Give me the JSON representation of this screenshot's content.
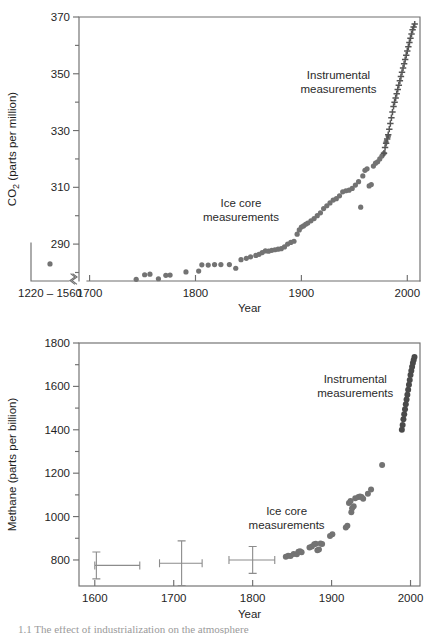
{
  "figure": {
    "background": "#ffffff",
    "marker_color_icecore": "#737373",
    "marker_color_instrumental": "#555555",
    "axis_color": "#6f6f6f",
    "errorbar_color": "#8c8c8c",
    "caption_partial": "1.1  The effect of industrialization on the atmosphere"
  },
  "chart_data": [
    {
      "type": "scatter",
      "id": "co2-panel",
      "title": "",
      "xlabel": "Year",
      "ylabel": "CO2 (parts per million)",
      "ylabel_parts": {
        "pre": "CO",
        "sub": "2",
        "post": " (parts per million)"
      },
      "xlim": [
        1690,
        2012
      ],
      "ylim": [
        277,
        370
      ],
      "grid": false,
      "legend": "none",
      "yticks": [
        290,
        310,
        330,
        350,
        370
      ],
      "yticklabels": [
        "290",
        "310",
        "330",
        "350",
        "370"
      ],
      "yminorticks": [
        280,
        300,
        320,
        340,
        360
      ],
      "xticks": [
        1700,
        1800,
        1900,
        2000
      ],
      "xticklabels": [
        "1700",
        "1800",
        "1900",
        "2000"
      ],
      "broken_axis": {
        "present": true,
        "inset_label": "1220 – 1560",
        "inset_points": [
          {
            "x_label": "1220-1560",
            "y": 283
          }
        ]
      },
      "annotations": [
        {
          "text_line1": "Instrumental",
          "text_line2": "measurements",
          "x": 1935,
          "y": 348
        },
        {
          "text_line1": "Ice core",
          "text_line2": "measurements",
          "x": 1843,
          "y": 303
        }
      ],
      "series": [
        {
          "name": "Ice core measurements",
          "marker": "circle",
          "color": "#737373",
          "points": [
            [
              1744,
              277.6
            ],
            [
              1752,
              279.2
            ],
            [
              1757,
              279.4
            ],
            [
              1765,
              277.8
            ],
            [
              1772,
              279.0
            ],
            [
              1776,
              279.1
            ],
            [
              1791,
              280.2
            ],
            [
              1803,
              280.5
            ],
            [
              1806,
              282.7
            ],
            [
              1812,
              282.6
            ],
            [
              1818,
              282.8
            ],
            [
              1824,
              282.8
            ],
            [
              1832,
              282.8
            ],
            [
              1838,
              281.5
            ],
            [
              1843,
              284.5
            ],
            [
              1848,
              285.0
            ],
            [
              1852,
              285.5
            ],
            [
              1857,
              286.0
            ],
            [
              1860,
              286.4
            ],
            [
              1863,
              287.0
            ],
            [
              1866,
              287.6
            ],
            [
              1869,
              287.5
            ],
            [
              1872,
              287.8
            ],
            [
              1875,
              288.0
            ],
            [
              1878,
              288.2
            ],
            [
              1881,
              288.4
            ],
            [
              1884,
              289.0
            ],
            [
              1887,
              290.0
            ],
            [
              1890,
              290.6
            ],
            [
              1893,
              291.0
            ],
            [
              1896,
              293.5
            ],
            [
              1898,
              295.0
            ],
            [
              1900,
              296.0
            ],
            [
              1902,
              296.4
            ],
            [
              1904,
              297.0
            ],
            [
              1906,
              297.4
            ],
            [
              1909,
              298.2
            ],
            [
              1912,
              299.0
            ],
            [
              1915,
              300.0
            ],
            [
              1918,
              301.0
            ],
            [
              1921,
              302.5
            ],
            [
              1924,
              303.5
            ],
            [
              1927,
              304.5
            ],
            [
              1930,
              305.5
            ],
            [
              1933,
              306.0
            ],
            [
              1936,
              307.0
            ],
            [
              1939,
              308.4
            ],
            [
              1942,
              308.8
            ],
            [
              1945,
              309.0
            ],
            [
              1948,
              309.6
            ],
            [
              1951,
              310.8
            ],
            [
              1954,
              312.0
            ],
            [
              1956,
              303.0
            ],
            [
              1958,
              314.0
            ],
            [
              1960,
              316.0
            ],
            [
              1962,
              316.5
            ],
            [
              1964,
              310.5
            ],
            [
              1966,
              311.0
            ],
            [
              1968,
              317.5
            ],
            [
              1970,
              318.5
            ],
            [
              1972,
              319.0
            ],
            [
              1974,
              320.0
            ],
            [
              1976,
              321.0
            ],
            [
              1978,
              322.0
            ],
            [
              1980,
              326.0
            ],
            [
              1982,
              328.0
            ]
          ]
        },
        {
          "name": "Instrumental measurements",
          "marker": "plus",
          "color": "#555555",
          "points": [
            [
              1978,
              322.0
            ],
            [
              1979,
              324.0
            ],
            [
              1980,
              325.5
            ],
            [
              1981,
              327.0
            ],
            [
              1982,
              328.5
            ],
            [
              1983,
              330.5
            ],
            [
              1984,
              332.5
            ],
            [
              1985,
              334.5
            ],
            [
              1986,
              336.5
            ],
            [
              1987,
              338.5
            ],
            [
              1988,
              340.0
            ],
            [
              1989,
              341.5
            ],
            [
              1990,
              343.0
            ],
            [
              1991,
              344.5
            ],
            [
              1992,
              346.0
            ],
            [
              1993,
              347.5
            ],
            [
              1994,
              349.0
            ],
            [
              1995,
              350.5
            ],
            [
              1996,
              352.0
            ],
            [
              1997,
              353.5
            ],
            [
              1998,
              355.0
            ],
            [
              1999,
              356.5
            ],
            [
              2000,
              358.0
            ],
            [
              2001,
              359.5
            ],
            [
              2002,
              361.0
            ],
            [
              2003,
              362.5
            ],
            [
              2004,
              364.0
            ],
            [
              2005,
              365.5
            ],
            [
              2006,
              366.5
            ],
            [
              2007,
              367.5
            ]
          ]
        }
      ]
    },
    {
      "type": "scatter",
      "id": "methane-panel",
      "title": "",
      "xlabel": "Year",
      "ylabel": "Methane (parts per billion)",
      "xlim": [
        1580,
        2012
      ],
      "ylim": [
        680,
        1800
      ],
      "grid": false,
      "legend": "none",
      "yticks": [
        800,
        1000,
        1200,
        1400,
        1600,
        1800
      ],
      "yticklabels": [
        "800",
        "1000",
        "1200",
        "1400",
        "1600",
        "1800"
      ],
      "yminorticks": [
        900,
        1100,
        1300,
        1500,
        1700
      ],
      "xticks": [
        1600,
        1700,
        1800,
        1900,
        2000
      ],
      "xticklabels": [
        "1600",
        "1700",
        "1800",
        "1900",
        "2000"
      ],
      "annotations": [
        {
          "text_line1": "Instrumental",
          "text_line2": "measurements",
          "x": 1930,
          "y": 1615
        },
        {
          "text_line1": "Ice core",
          "text_line2": "measurements",
          "x": 1843,
          "y": 1005
        }
      ],
      "error_points": [
        {
          "x": 1602,
          "y": 775,
          "xerr_low": 2,
          "xerr_high": 55,
          "yerr": 62
        },
        {
          "x": 1710,
          "y": 785,
          "xerr_low": 28,
          "xerr_high": 26,
          "yerr": 103
        },
        {
          "x": 1800,
          "y": 800,
          "xerr_low": 30,
          "xerr_high": 28,
          "yerr": 62
        }
      ],
      "series": [
        {
          "name": "Ice core measurements",
          "marker": "circle",
          "color": "#737373",
          "points": [
            [
              1842,
              815
            ],
            [
              1845,
              820
            ],
            [
              1848,
              818
            ],
            [
              1852,
              828
            ],
            [
              1856,
              826
            ],
            [
              1858,
              838
            ],
            [
              1860,
              840
            ],
            [
              1862,
              836
            ],
            [
              1872,
              858
            ],
            [
              1875,
              862
            ],
            [
              1878,
              872
            ],
            [
              1880,
              875
            ],
            [
              1882,
              845
            ],
            [
              1884,
              848
            ],
            [
              1886,
              876
            ],
            [
              1888,
              874
            ],
            [
              1898,
              910
            ],
            [
              1901,
              918
            ],
            [
              1918,
              950
            ],
            [
              1920,
              958
            ],
            [
              1922,
              1062
            ],
            [
              1924,
              1072
            ],
            [
              1925,
              1020
            ],
            [
              1926,
              1038
            ],
            [
              1928,
              1048
            ],
            [
              1930,
              1085
            ],
            [
              1934,
              1090
            ],
            [
              1936,
              1092
            ],
            [
              1938,
              1090
            ],
            [
              1940,
              1082
            ],
            [
              1946,
              1105
            ],
            [
              1950,
              1125
            ],
            [
              1964,
              1238
            ]
          ]
        },
        {
          "name": "Instrumental measurements",
          "marker": "circle",
          "color": "#4a4a4a",
          "points": [
            [
              1989,
              1400
            ],
            [
              1990,
              1422
            ],
            [
              1991,
              1448
            ],
            [
              1992,
              1472
            ],
            [
              1993,
              1495
            ],
            [
              1994,
              1518
            ],
            [
              1995,
              1540
            ],
            [
              1996,
              1562
            ],
            [
              1997,
              1585
            ],
            [
              1998,
              1608
            ],
            [
              1999,
              1630
            ],
            [
              2000,
              1652
            ],
            [
              2001,
              1672
            ],
            [
              2002,
              1690
            ],
            [
              2003,
              1708
            ],
            [
              2004,
              1722
            ],
            [
              2005,
              1735
            ]
          ]
        }
      ]
    }
  ]
}
